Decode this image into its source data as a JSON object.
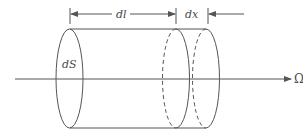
{
  "diagram": {
    "labels": {
      "surface": "dS",
      "length": "dl",
      "increment": "dx",
      "direction": "Ω"
    },
    "colors": {
      "stroke": "#555555",
      "text": "#4a4a4a",
      "background": "#ffffff"
    }
  }
}
